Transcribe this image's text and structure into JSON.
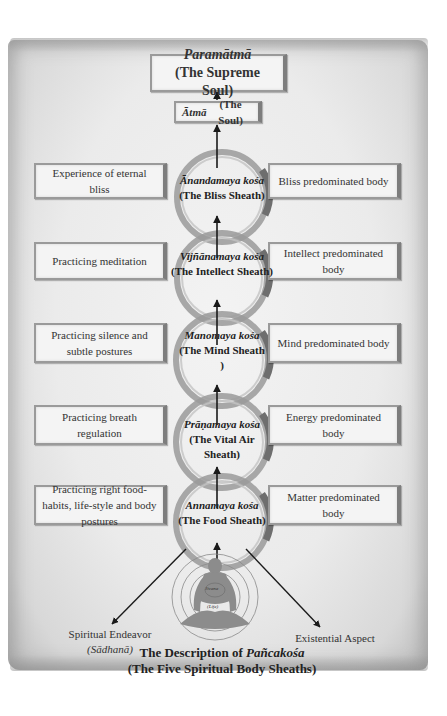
{
  "top": {
    "paramatma_sanskrit": "Paramātmā",
    "paramatma_english": "(The Supreme Soul)",
    "atma_sanskrit": "Ātmā",
    "atma_english": "(The Soul)"
  },
  "sheaths": [
    {
      "sanskrit": "Ānandamaya kośa",
      "english": "(The Bliss Sheath)",
      "left": "Experience of eternal bliss",
      "right": "Bliss predominated body"
    },
    {
      "sanskrit": "Vijñānamaya kośa",
      "english": "(The Intellect Sheath)",
      "left": "Practicing meditation",
      "right": "Intellect predominated body"
    },
    {
      "sanskrit": "Manomaya kośa",
      "english": "(The Mind Sheath )",
      "left": "Practicing silence and subtle postures",
      "right": "Mind predominated body"
    },
    {
      "sanskrit": "Prāṇamaya kośa",
      "english": "(The Vital Air Sheath)",
      "left": "Practicing breath regulation",
      "right": "Energy predominated body"
    },
    {
      "sanskrit": "Annamaya kośa",
      "english": "(The Food Sheath)",
      "left": "Practicing right food-habits, life-style and body postures",
      "right": "Matter predominated body"
    }
  ],
  "figure": {
    "inner_label_1": "Jivana",
    "inner_label_2": "(Life)"
  },
  "bottom": {
    "left_label": "Spiritual Endeavor",
    "left_sublabel": "(Sādhanā)",
    "right_label": "Existential Aspect",
    "caption_line1_prefix": "The Description of ",
    "caption_line1_italic": "Pañcakośa",
    "caption_line2": "(The Five Spiritual Body Sheaths)"
  },
  "colors": {
    "parchment": "#ebebeb",
    "ring": "#8a8a8a",
    "figure": "#8c8c8c",
    "arrow": "#1a1a1a",
    "box_border": "#9a9a9a"
  }
}
